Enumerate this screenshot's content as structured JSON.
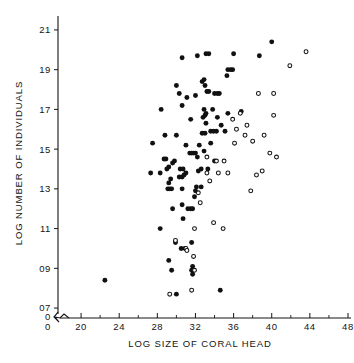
{
  "chart_data": {
    "type": "scatter",
    "title": "",
    "xlabel": "LOG SIZE OF CORAL HEAD",
    "ylabel": "LOG NUMBER OF INDIVIDUALS",
    "xlim": [
      18,
      48
    ],
    "ylim": [
      0.65,
      2.15
    ],
    "grid": false,
    "legend_position": "none",
    "axis_break": true,
    "origin_label_x": "0",
    "origin_label_y": "0",
    "xticks": [
      20,
      24,
      28,
      32,
      36,
      40,
      44,
      48
    ],
    "xticklabels": [
      "20",
      "24",
      "28",
      "32",
      "36",
      "40",
      "44",
      "48"
    ],
    "xminorticks": [
      22,
      26,
      30,
      34,
      38,
      42,
      46
    ],
    "yticks": [
      0.7,
      0.9,
      1.1,
      1.3,
      1.5,
      1.7,
      1.9,
      2.1
    ],
    "yticklabels": [
      "07",
      "09",
      "11",
      "13",
      "15",
      "17",
      "19",
      "21"
    ],
    "series": [
      {
        "name": "filled",
        "marker": "filled-circle",
        "color": "#111111",
        "points": [
          [
            22.5,
            0.84
          ],
          [
            29.2,
            0.94
          ],
          [
            29.5,
            0.89
          ],
          [
            31.6,
            0.89
          ],
          [
            31.7,
            0.91
          ],
          [
            31.7,
            0.87
          ],
          [
            34.6,
            0.79
          ],
          [
            30.0,
            0.77
          ],
          [
            29.9,
            1.03
          ],
          [
            30.5,
            1.0
          ],
          [
            30.9,
            1.0
          ],
          [
            31.6,
            1.03
          ],
          [
            28.3,
            1.1
          ],
          [
            30.7,
            1.15
          ],
          [
            31.2,
            1.2
          ],
          [
            31.5,
            1.2
          ],
          [
            31.7,
            1.2
          ],
          [
            29.6,
            1.2
          ],
          [
            30.6,
            1.22
          ],
          [
            31.9,
            1.26
          ],
          [
            32.0,
            1.29
          ],
          [
            32.1,
            1.31
          ],
          [
            32.6,
            1.31
          ],
          [
            29.1,
            1.3
          ],
          [
            29.3,
            1.3
          ],
          [
            29.5,
            1.3
          ],
          [
            30.6,
            1.3
          ],
          [
            29.2,
            1.33
          ],
          [
            29.4,
            1.35
          ],
          [
            30.3,
            1.36
          ],
          [
            30.6,
            1.36
          ],
          [
            30.8,
            1.37
          ],
          [
            31.0,
            1.38
          ],
          [
            27.3,
            1.38
          ],
          [
            28.3,
            1.38
          ],
          [
            29.0,
            1.4
          ],
          [
            29.2,
            1.41
          ],
          [
            30.4,
            1.4
          ],
          [
            30.7,
            1.4
          ],
          [
            32.3,
            1.39
          ],
          [
            32.6,
            1.4
          ],
          [
            33.3,
            1.4
          ],
          [
            29.6,
            1.43
          ],
          [
            29.8,
            1.44
          ],
          [
            28.7,
            1.45
          ],
          [
            28.9,
            1.45
          ],
          [
            32.2,
            1.46
          ],
          [
            34.0,
            1.44
          ],
          [
            31.4,
            1.48
          ],
          [
            31.6,
            1.48
          ],
          [
            31.8,
            1.48
          ],
          [
            32.0,
            1.48
          ],
          [
            32.9,
            1.49
          ],
          [
            31.0,
            1.52
          ],
          [
            32.4,
            1.52
          ],
          [
            27.5,
            1.53
          ],
          [
            33.6,
            1.53
          ],
          [
            28.8,
            1.57
          ],
          [
            30.0,
            1.57
          ],
          [
            32.7,
            1.58
          ],
          [
            33.0,
            1.58
          ],
          [
            33.6,
            1.59
          ],
          [
            33.9,
            1.59
          ],
          [
            34.2,
            1.59
          ],
          [
            35.1,
            1.59
          ],
          [
            34.7,
            1.62
          ],
          [
            33.1,
            1.63
          ],
          [
            31.5,
            1.65
          ],
          [
            34.3,
            1.66
          ],
          [
            32.8,
            1.66
          ],
          [
            33.0,
            1.67
          ],
          [
            33.1,
            1.68
          ],
          [
            35.4,
            1.68
          ],
          [
            36.8,
            1.69
          ],
          [
            28.4,
            1.7
          ],
          [
            32.9,
            1.7
          ],
          [
            33.8,
            1.7
          ],
          [
            30.6,
            1.72
          ],
          [
            31.1,
            1.76
          ],
          [
            32.0,
            1.77
          ],
          [
            30.3,
            1.78
          ],
          [
            33.2,
            1.79
          ],
          [
            33.4,
            1.79
          ],
          [
            34.0,
            1.78
          ],
          [
            34.3,
            1.78
          ],
          [
            34.5,
            1.78
          ],
          [
            33.0,
            1.82
          ],
          [
            30.0,
            1.82
          ],
          [
            32.7,
            1.84
          ],
          [
            32.9,
            1.85
          ],
          [
            35.3,
            1.87
          ],
          [
            35.4,
            1.9
          ],
          [
            35.7,
            1.9
          ],
          [
            35.9,
            1.9
          ],
          [
            30.6,
            1.96
          ],
          [
            32.2,
            1.97
          ],
          [
            33.1,
            1.98
          ],
          [
            33.4,
            1.98
          ],
          [
            36.0,
            1.98
          ],
          [
            38.7,
            1.97
          ],
          [
            40.0,
            2.04
          ]
        ]
      },
      {
        "name": "open",
        "marker": "open-circle",
        "color": "#ffffff",
        "points": [
          [
            29.3,
            0.77
          ],
          [
            31.6,
            0.79
          ],
          [
            31.9,
            0.89
          ],
          [
            31.8,
            0.96
          ],
          [
            31.0,
            1.0
          ],
          [
            31.1,
            0.99
          ],
          [
            29.9,
            1.04
          ],
          [
            31.9,
            1.1
          ],
          [
            33.9,
            1.13
          ],
          [
            34.9,
            1.1
          ],
          [
            32.5,
            1.23
          ],
          [
            32.3,
            1.28
          ],
          [
            33.5,
            1.34
          ],
          [
            33.2,
            1.38
          ],
          [
            34.4,
            1.38
          ],
          [
            35.4,
            1.38
          ],
          [
            38.4,
            1.37
          ],
          [
            39.0,
            1.39
          ],
          [
            37.8,
            1.29
          ],
          [
            34.2,
            1.44
          ],
          [
            35.0,
            1.44
          ],
          [
            33.2,
            1.46
          ],
          [
            40.5,
            1.46
          ],
          [
            39.8,
            1.48
          ],
          [
            36.1,
            1.53
          ],
          [
            38.0,
            1.54
          ],
          [
            37.2,
            1.57
          ],
          [
            39.2,
            1.57
          ],
          [
            36.3,
            1.6
          ],
          [
            37.4,
            1.62
          ],
          [
            35.9,
            1.65
          ],
          [
            40.2,
            1.67
          ],
          [
            36.7,
            1.68
          ],
          [
            38.6,
            1.78
          ],
          [
            40.2,
            1.78
          ],
          [
            41.9,
            1.92
          ],
          [
            43.6,
            1.99
          ]
        ]
      }
    ]
  }
}
